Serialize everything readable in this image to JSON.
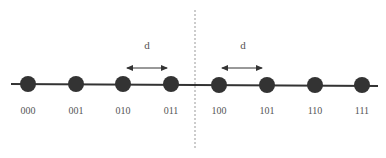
{
  "diagram": {
    "nodes": [
      {
        "label": "000",
        "x": 28
      },
      {
        "label": "001",
        "x": 76
      },
      {
        "label": "010",
        "x": 123
      },
      {
        "label": "011",
        "x": 171
      },
      {
        "label": "100",
        "x": 218
      },
      {
        "label": "101",
        "x": 266
      },
      {
        "label": "110",
        "x": 314
      },
      {
        "label": "111",
        "x": 362
      }
    ],
    "distance_label": "d",
    "distance_markers": [
      {
        "from": "010",
        "to": "011",
        "label": "d"
      },
      {
        "from": "100",
        "to": "101",
        "label": "d"
      }
    ],
    "divider": "dashed vertical line between 011 and 100",
    "colors": {
      "node": "#333333",
      "line": "#333333",
      "divider": "#888888",
      "text": "#555555"
    }
  }
}
